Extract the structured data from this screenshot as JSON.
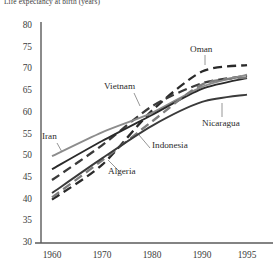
{
  "chart_data": {
    "type": "line",
    "title": "Life expectancy at birth (years)",
    "xlabel": "",
    "ylabel": "",
    "ylim": [
      30,
      80
    ],
    "xlim": [
      1960,
      1995
    ],
    "grid": false,
    "legend_position": "inline-annotations",
    "yticks": [
      30,
      35,
      40,
      45,
      50,
      55,
      60,
      65,
      70,
      75,
      80
    ],
    "xticks": [
      1960,
      1970,
      1980,
      1990,
      1995
    ],
    "x": [
      1960,
      1970,
      1980,
      1990,
      1995
    ],
    "series": [
      {
        "name": "Oman",
        "style": "dashed",
        "color": "#2a2a2a",
        "values": [
          40.0,
          48.0,
          60.5,
          69.5,
          71.0
        ]
      },
      {
        "name": "Vietnam",
        "style": "dashed",
        "color": "#3a3a3a",
        "values": [
          44.5,
          52.5,
          61.5,
          66.8,
          68.5
        ]
      },
      {
        "name": "Iran",
        "style": "solid",
        "color": "#8c8c8c",
        "values": [
          50.0,
          55.5,
          60.0,
          66.0,
          68.8
        ]
      },
      {
        "name": "Indonesia",
        "style": "solid",
        "color": "#2a2a2a",
        "values": [
          47.0,
          53.5,
          59.5,
          65.5,
          68.0
        ]
      },
      {
        "name": "Algeria",
        "style": "dashed",
        "color": "#7d7d7d",
        "values": [
          40.5,
          49.0,
          58.0,
          66.5,
          68.2
        ]
      },
      {
        "name": "Nicaragua",
        "style": "solid",
        "color": "#3a3a3a",
        "values": [
          41.5,
          49.5,
          57.0,
          62.5,
          64.2
        ]
      }
    ],
    "annotations": [
      {
        "label": "Oman",
        "leader": "down"
      },
      {
        "label": "Vietnam",
        "leader": "down-right"
      },
      {
        "label": "Iran",
        "leader": "down-right"
      },
      {
        "label": "Indonesia",
        "leader": "up-left"
      },
      {
        "label": "Algeria",
        "leader": "up-left"
      },
      {
        "label": "Nicaragua",
        "leader": "up"
      }
    ]
  }
}
